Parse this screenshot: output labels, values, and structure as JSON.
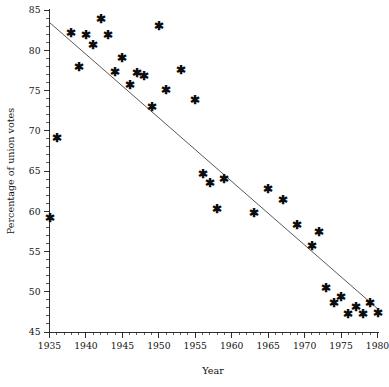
{
  "chart_data": {
    "type": "scatter",
    "title": "",
    "xlabel": "Year",
    "ylabel": "Percentage of union votes",
    "xlim": [
      1935,
      1980
    ],
    "ylim": [
      45,
      85
    ],
    "xticks": [
      1935,
      1940,
      1945,
      1950,
      1955,
      1960,
      1965,
      1970,
      1975,
      1980
    ],
    "yticks": [
      45,
      50,
      55,
      60,
      65,
      70,
      75,
      80,
      85
    ],
    "xtick_labels": [
      "1935",
      "1940",
      "1945",
      "1950",
      "1955",
      "1960",
      "1965",
      "1970",
      "1975",
      "1980"
    ],
    "ytick_labels": [
      "45",
      "50",
      "55",
      "60",
      "65",
      "70",
      "75",
      "80",
      "85"
    ],
    "x_minor_tick_step": 1,
    "y_minor_tick_step": 1,
    "grid": false,
    "legend": false,
    "marker_symbol": "asterisk",
    "marker_color": "#0d0d0d",
    "points": [
      {
        "x": 1935,
        "y": 59.2
      },
      {
        "x": 1936,
        "y": 69.1
      },
      {
        "x": 1938,
        "y": 82.2
      },
      {
        "x": 1939,
        "y": 78.0
      },
      {
        "x": 1940,
        "y": 81.9
      },
      {
        "x": 1941,
        "y": 80.7
      },
      {
        "x": 1942,
        "y": 83.9
      },
      {
        "x": 1943,
        "y": 81.9
      },
      {
        "x": 1944,
        "y": 77.3
      },
      {
        "x": 1945,
        "y": 79.1
      },
      {
        "x": 1946,
        "y": 75.7
      },
      {
        "x": 1947,
        "y": 77.2
      },
      {
        "x": 1948,
        "y": 76.9
      },
      {
        "x": 1949,
        "y": 73.0
      },
      {
        "x": 1950,
        "y": 83.0
      },
      {
        "x": 1951,
        "y": 75.1
      },
      {
        "x": 1953,
        "y": 77.6
      },
      {
        "x": 1955,
        "y": 73.9
      },
      {
        "x": 1956,
        "y": 64.7
      },
      {
        "x": 1957,
        "y": 63.6
      },
      {
        "x": 1958,
        "y": 60.3
      },
      {
        "x": 1959,
        "y": 64.1
      },
      {
        "x": 1963,
        "y": 59.8
      },
      {
        "x": 1965,
        "y": 62.8
      },
      {
        "x": 1967,
        "y": 61.4
      },
      {
        "x": 1969,
        "y": 58.3
      },
      {
        "x": 1971,
        "y": 55.7
      },
      {
        "x": 1972,
        "y": 57.5
      },
      {
        "x": 1973,
        "y": 50.5
      },
      {
        "x": 1974,
        "y": 48.6
      },
      {
        "x": 1975,
        "y": 49.4
      },
      {
        "x": 1976,
        "y": 47.3
      },
      {
        "x": 1977,
        "y": 48.2
      },
      {
        "x": 1978,
        "y": 47.3
      },
      {
        "x": 1979,
        "y": 48.6
      },
      {
        "x": 1980,
        "y": 47.4
      }
    ],
    "fit_line": {
      "type": "line",
      "x": [
        1935,
        1980
      ],
      "y": [
        83.45,
        47.9
      ]
    }
  }
}
